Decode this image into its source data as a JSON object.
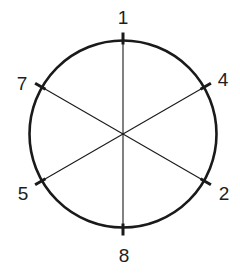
{
  "diagram": {
    "center": [
      123,
      134
    ],
    "radius": 93.5,
    "stroke_color": "#1a1a1a",
    "label_color": "#1e1e1e",
    "points": [
      {
        "label": "1",
        "angle_deg": 90
      },
      {
        "label": "4",
        "angle_deg": 30
      },
      {
        "label": "2",
        "angle_deg": -30
      },
      {
        "label": "8",
        "angle_deg": -90
      },
      {
        "label": "5",
        "angle_deg": -150
      },
      {
        "label": "7",
        "angle_deg": 150
      }
    ],
    "diameters": [
      [
        "1",
        "8"
      ],
      [
        "7",
        "2"
      ],
      [
        "4",
        "5"
      ]
    ]
  }
}
